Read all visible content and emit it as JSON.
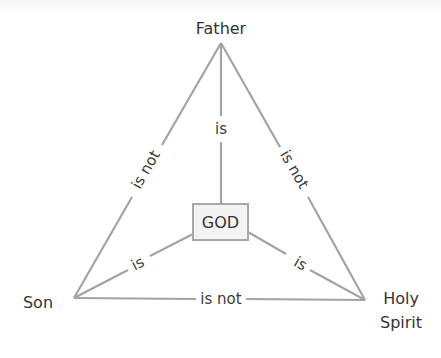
{
  "diagram": {
    "nodes": {
      "father": {
        "label": "Father"
      },
      "son": {
        "label": "Son"
      },
      "spirit": {
        "label_line1": "Holy",
        "label_line2": "Spirit"
      },
      "center": {
        "label": "GOD"
      }
    },
    "edges": {
      "father_son": "is not",
      "father_spirit": "is not",
      "son_spirit": "is not",
      "father_god": "is",
      "son_god": "is",
      "spirit_god": "is"
    },
    "colors": {
      "line": "#a3a3a3",
      "text": "#333333",
      "box_fill": "#f3f3f3",
      "box_border": "#a8a8a8"
    }
  }
}
